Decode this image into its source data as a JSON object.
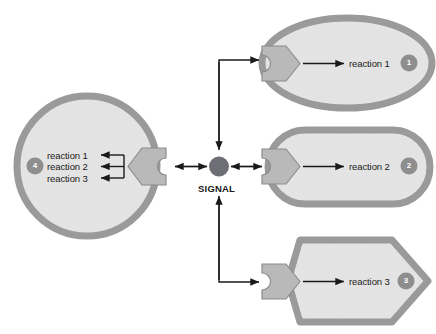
{
  "figure": {
    "background_color": "#ffffff",
    "cell_fill": "#e3e3e3",
    "cell_border": "#9a9a9a",
    "receptor_fill": "#b9b9b9",
    "receptor_border": "#8c8c8c",
    "signal_color": "#6e6e76",
    "badge_color": "#8e8e8e",
    "arrow_color": "#1a1a1a"
  },
  "signal": {
    "label": "SIGNAL",
    "shape": "filled-circle"
  },
  "cells": [
    {
      "id": "cell-1",
      "badge": "1",
      "shape": "ellipse",
      "reactions": [
        "reaction 1"
      ]
    },
    {
      "id": "cell-2",
      "badge": "2",
      "shape": "stadium",
      "reactions": [
        "reaction 2"
      ]
    },
    {
      "id": "cell-3",
      "badge": "3",
      "shape": "hexagon",
      "reactions": [
        "reaction 3"
      ]
    },
    {
      "id": "cell-4",
      "badge": "4",
      "shape": "circle",
      "reactions": [
        "reaction 1",
        "reaction 2",
        "reaction 3"
      ]
    }
  ],
  "connections": [
    {
      "from": "signal",
      "to": "cell-1",
      "style": "elbow-up-right"
    },
    {
      "from": "signal",
      "to": "cell-2",
      "style": "double-arrow-right"
    },
    {
      "from": "signal",
      "to": "cell-3",
      "style": "elbow-down-right"
    },
    {
      "from": "signal",
      "to": "cell-4",
      "style": "double-arrow-left"
    }
  ]
}
